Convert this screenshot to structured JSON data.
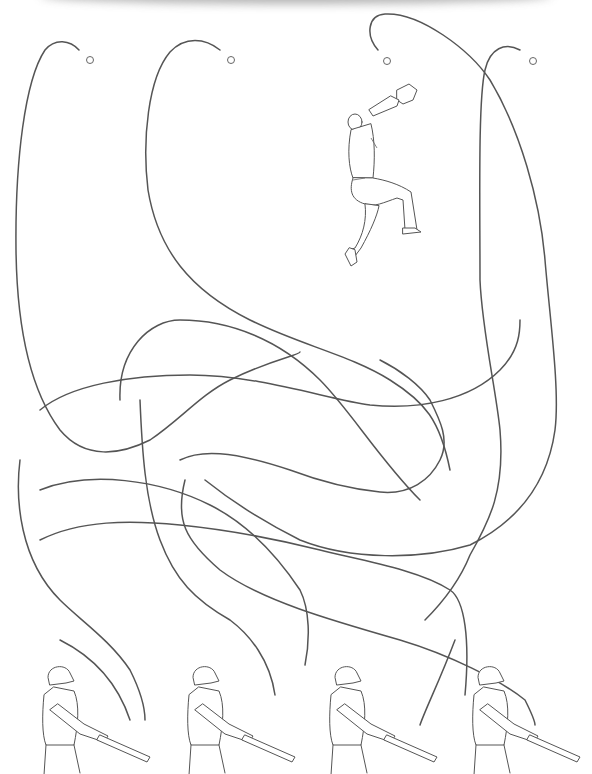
{
  "puzzle": {
    "type": "tangled-path maze",
    "title": "",
    "stroke_color": "#555555",
    "background": "#ffffff"
  },
  "top": {
    "balls": [
      {
        "id": "ball-1",
        "x": 90,
        "y": 60
      },
      {
        "id": "ball-2",
        "x": 231,
        "y": 60
      },
      {
        "id": "ball-3",
        "x": 387,
        "y": 61
      },
      {
        "id": "ball-4",
        "x": 533,
        "y": 61
      }
    ],
    "fielder": {
      "label": "outfielder-catching",
      "x": 345,
      "y": 80
    }
  },
  "bottom": {
    "batters": [
      {
        "id": "batter-1",
        "x": 40
      },
      {
        "id": "batter-2",
        "x": 185
      },
      {
        "id": "batter-3",
        "x": 327
      },
      {
        "id": "batter-4",
        "x": 470
      }
    ]
  }
}
